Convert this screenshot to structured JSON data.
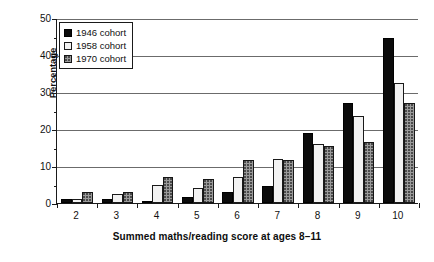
{
  "chart_data": {
    "type": "bar",
    "title": "",
    "xlabel": "Summed maths/reading score at ages 8–11",
    "ylabel": "Percentage",
    "categories": [
      "2",
      "3",
      "4",
      "5",
      "6",
      "7",
      "8",
      "9",
      "10"
    ],
    "series": [
      {
        "name": "1946 cohort",
        "color": "#0b0b0b",
        "values": [
          1,
          1,
          0.5,
          1.5,
          3,
          4.5,
          19,
          27,
          44.5
        ]
      },
      {
        "name": "1958 cohort",
        "color": "#f2f2f2",
        "values": [
          1,
          2.5,
          5,
          4,
          7,
          12,
          16,
          23.5,
          32.5
        ]
      },
      {
        "name": "1970 cohort",
        "color": "#9a9a9a",
        "values": [
          3,
          3,
          7,
          6.5,
          11.5,
          11.5,
          15.5,
          16.5,
          27
        ]
      }
    ],
    "ylim": [
      0,
      50
    ],
    "y_ticks": [
      0,
      10,
      20,
      30,
      40,
      50
    ],
    "y_minor_ticks": [
      5,
      15,
      25,
      35,
      45
    ],
    "grid": true,
    "legend_position": "top-left"
  }
}
